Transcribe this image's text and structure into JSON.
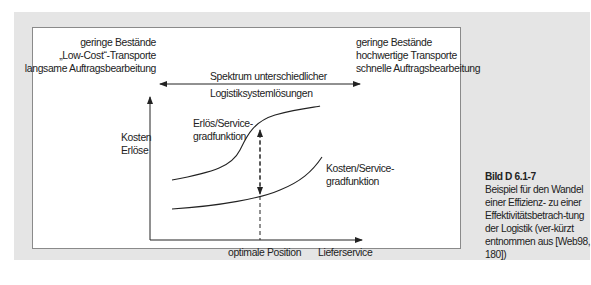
{
  "diagram": {
    "left_block": [
      "geringe Bestände",
      "„Low-Cost“-Transporte",
      "langsame Auftragsbearbeitung"
    ],
    "right_block": [
      "geringe Bestände",
      "hochwertige Transporte",
      "schnelle Auftragsbearbeitung"
    ],
    "spectrum_label": [
      "Spektrum unterschiedlicher",
      "Logistiksystemlösungen"
    ],
    "y_axis_label": [
      "Kosten",
      "Erlöse"
    ],
    "x_axis_label": "Lieferservice",
    "optimum_label": "optimale Position",
    "revenue_curve_label": [
      "Erlös/Service-",
      "gradfunktion"
    ],
    "cost_curve_label": [
      "Kosten/Service-",
      "gradfunktion"
    ]
  },
  "caption": {
    "title": "Bild D 6.1-7",
    "text": "Beispiel für den Wandel einer Effizienz- zu einer Effektivitätsbetrach-tung der Logistik (ver-kürzt entnommen aus [Web98, 180])"
  },
  "colors": {
    "band": "#e5e5e5",
    "panel_border": "#8a8a8a",
    "line": "#222222"
  }
}
